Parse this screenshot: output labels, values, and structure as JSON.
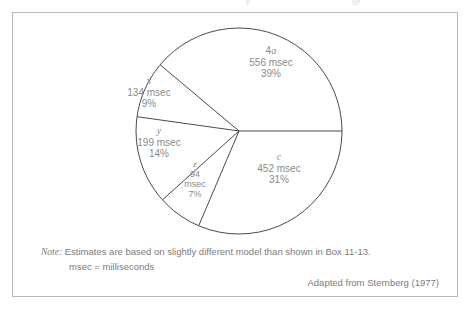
{
  "figure": {
    "top_bleed": [
      {
        "text": "p",
        "left": 246
      },
      {
        "text": "gy",
        "left": 352
      }
    ],
    "note": {
      "label": "Note:",
      "line1": "Estimates are based on slightly different model than shown in Box 11-13.",
      "line2": "msec = milliseconds"
    },
    "credit": "Adapted from Sternberg (1977)"
  },
  "chart_data": {
    "type": "pie",
    "title": "",
    "unit": "msec",
    "total_msec": 1435,
    "legend_position": "none",
    "grid": false,
    "labels_inside": true,
    "start_angle_deg": 0,
    "direction": "counterclockwise",
    "stroke_color": "#4a4a4a",
    "fill_color": "#ffffff",
    "text_color": "#8a8a8a",
    "categories": [
      "4a",
      "x",
      "y",
      "z",
      "c"
    ],
    "values": [
      556,
      134,
      199,
      94,
      452
    ],
    "percentages": [
      39,
      9,
      14,
      7,
      31
    ],
    "slices": [
      {
        "key": "4a",
        "key_numeral": "4",
        "key_letter": "a",
        "value_label": "556 msec",
        "percent_label": "39%",
        "value": 556,
        "percent": 39,
        "start_deg": 0,
        "end_deg": 140
      },
      {
        "key": "x",
        "value_label": "134 msec",
        "percent_label": "9%",
        "value": 134,
        "percent": 9,
        "start_deg": 140,
        "end_deg": 172
      },
      {
        "key": "y",
        "value_label": "199 msec",
        "percent_label": "14%",
        "value": 199,
        "percent": 14,
        "start_deg": 172,
        "end_deg": 222
      },
      {
        "key": "z",
        "value_label": "94",
        "value_label2": "msec",
        "percent_label": "7%",
        "value": 94,
        "percent": 7,
        "start_deg": 222,
        "end_deg": 247
      },
      {
        "key": "c",
        "value_label": "452 msec",
        "percent_label": "31%",
        "value": 452,
        "percent": 31,
        "start_deg": 247,
        "end_deg": 360
      }
    ]
  }
}
